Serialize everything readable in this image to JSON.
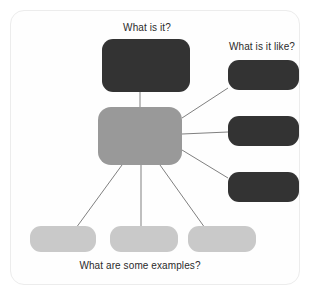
{
  "diagram": {
    "labels": {
      "top": "What is it?",
      "right": "What is it like?",
      "bottom": "What are some examples?"
    },
    "colors": {
      "dark_node": "#333333",
      "center_node": "#999999",
      "light_node": "#c9c9c9",
      "connector": "#808080",
      "card_border": "#ececec",
      "background": "#ffffff",
      "text": "#2b2b2b"
    },
    "nodes": [
      {
        "id": "center",
        "role": "central-concept",
        "fill": "#999999",
        "x": 98,
        "y": 107,
        "w": 84,
        "h": 58
      },
      {
        "id": "top",
        "role": "definition",
        "fill": "#333333",
        "x": 102,
        "y": 39,
        "w": 88,
        "h": 53
      },
      {
        "id": "right-1",
        "role": "attribute",
        "fill": "#333333",
        "x": 228,
        "y": 60,
        "w": 71,
        "h": 30
      },
      {
        "id": "right-2",
        "role": "attribute",
        "fill": "#333333",
        "x": 228,
        "y": 116,
        "w": 71,
        "h": 30
      },
      {
        "id": "right-3",
        "role": "attribute",
        "fill": "#333333",
        "x": 228,
        "y": 172,
        "w": 71,
        "h": 30
      },
      {
        "id": "bottom-1",
        "role": "example",
        "fill": "#c9c9c9",
        "x": 30,
        "y": 226,
        "w": 66,
        "h": 26
      },
      {
        "id": "bottom-2",
        "role": "example",
        "fill": "#c9c9c9",
        "x": 110,
        "y": 226,
        "w": 68,
        "h": 26
      },
      {
        "id": "bottom-3",
        "role": "example",
        "fill": "#c9c9c9",
        "x": 188,
        "y": 226,
        "w": 68,
        "h": 26
      }
    ],
    "edges": [
      {
        "from": "center",
        "to": "top",
        "x1": 140,
        "y1": 107,
        "x2": 140,
        "y2": 92
      },
      {
        "from": "center",
        "to": "right-1",
        "x1": 182,
        "y1": 118,
        "x2": 228,
        "y2": 88
      },
      {
        "from": "center",
        "to": "right-2",
        "x1": 182,
        "y1": 134,
        "x2": 228,
        "y2": 132
      },
      {
        "from": "center",
        "to": "right-3",
        "x1": 182,
        "y1": 150,
        "x2": 228,
        "y2": 178
      },
      {
        "from": "center",
        "to": "bottom-1",
        "x1": 122,
        "y1": 165,
        "x2": 76,
        "y2": 228
      },
      {
        "from": "center",
        "to": "bottom-2",
        "x1": 141,
        "y1": 165,
        "x2": 141,
        "y2": 226
      },
      {
        "from": "center",
        "to": "bottom-3",
        "x1": 160,
        "y1": 165,
        "x2": 205,
        "y2": 228
      }
    ]
  }
}
